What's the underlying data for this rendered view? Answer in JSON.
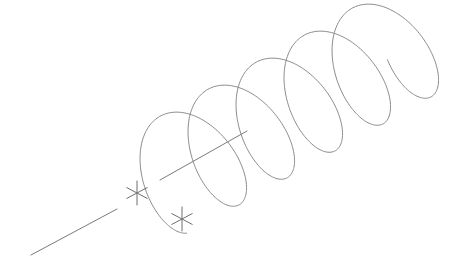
{
  "canvas": {
    "width": 456,
    "height": 259,
    "background": "#ffffff"
  },
  "style": {
    "stroke": "#8a8a8a",
    "axis_stroke": "#7a7a7a",
    "marker_stroke": "#6e6e6e",
    "stroke_width": 1
  },
  "axis": {
    "segments": [
      {
        "x1": 31,
        "y1": 255,
        "x2": 117,
        "y2": 209
      },
      {
        "x1": 160,
        "y1": 180,
        "x2": 247,
        "y2": 131
      }
    ]
  },
  "markers": [
    {
      "name": "helix-start-point",
      "cx": 137,
      "cy": 193,
      "size": 12
    },
    {
      "name": "helix-base-point",
      "cx": 182,
      "cy": 219,
      "size": 12
    }
  ],
  "helix": {
    "turns": 5,
    "start": {
      "cx": 165,
      "cy": 180
    },
    "step": {
      "dx": 48,
      "dy": -27
    },
    "rx": 34,
    "ry": 58,
    "rotation_deg": -28,
    "start_angle_deg": 100,
    "end_extra_deg": 75
  }
}
